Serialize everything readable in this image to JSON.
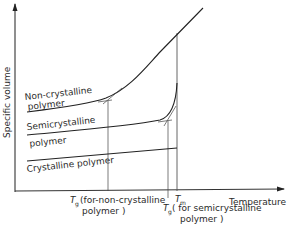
{
  "diagram": {
    "type": "specific-volume-vs-temperature",
    "axes": {
      "y_label": "Specific volume",
      "x_label": "Temperature"
    },
    "curves": [
      {
        "id": "non-crystalline",
        "label_line1": "Non-crystalline",
        "label_line2": "polymer"
      },
      {
        "id": "semicrystalline",
        "label_line1": "Semicrystalline",
        "label_line2": "polymer"
      },
      {
        "id": "crystalline",
        "label_line1": "Crystalline polymer"
      }
    ],
    "markers": {
      "tg_non_crystalline": {
        "symbol": "T",
        "sub": "g",
        "text_line1": "(for-non-crystalline",
        "text_line2": "polymer )"
      },
      "tm": {
        "symbol": "T",
        "sub": "m"
      },
      "tg_semicrystalline": {
        "symbol": "T",
        "sub": "g",
        "text_line1": "( for semicrystalline",
        "text_line2": "polymer )"
      }
    },
    "colors": {
      "line": "#222222",
      "text": "#2a2a2a",
      "background": "#ffffff"
    }
  }
}
